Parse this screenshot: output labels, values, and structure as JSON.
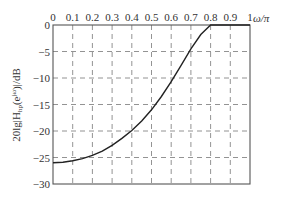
{
  "chart_data": {
    "type": "line",
    "title": "",
    "xlabel": "ω/π",
    "ylabel": "20lg|H_hp(e^jω)|/dB",
    "xlim": [
      0,
      1
    ],
    "ylim": [
      -30,
      0
    ],
    "grid": true,
    "grid_style": "dashed",
    "x_ticks": [
      "0",
      "0.1",
      "0.2",
      "0.3",
      "0.4",
      "0.5",
      "0.6",
      "0.7",
      "0.8",
      "0.9",
      "1"
    ],
    "y_ticks": [
      "0",
      "-5",
      "-10",
      "-15",
      "-20",
      "-25",
      "-30"
    ],
    "series": [
      {
        "name": "highpass magnitude response",
        "x": [
          0,
          0.05,
          0.1,
          0.15,
          0.2,
          0.25,
          0.3,
          0.35,
          0.4,
          0.45,
          0.5,
          0.55,
          0.6,
          0.65,
          0.7,
          0.75,
          0.8,
          0.85,
          0.9,
          0.95,
          1.0
        ],
        "y": [
          -26,
          -25.9,
          -25.6,
          -25.2,
          -24.6,
          -23.8,
          -22.7,
          -21.4,
          -19.9,
          -18.1,
          -16.0,
          -13.5,
          -10.7,
          -7.6,
          -4.5,
          -1.8,
          0,
          0,
          0,
          0,
          0
        ]
      }
    ]
  },
  "axes": {
    "x_label": "ω/π",
    "y_label": "20lg|H",
    "y_label_sub": "hp",
    "y_label_tail": "(e",
    "y_label_sup": "jω",
    "y_label_end": ")|/dB"
  }
}
